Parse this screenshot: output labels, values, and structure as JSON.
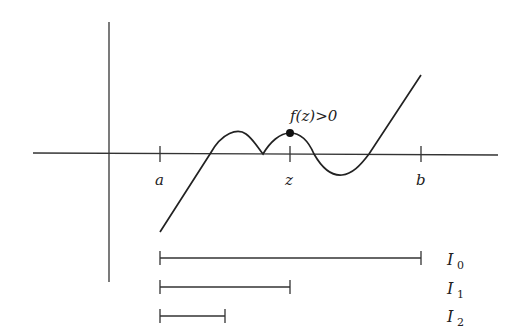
{
  "diagram": {
    "labels": {
      "a": "a",
      "z": "z",
      "b": "b",
      "annotation": "f(z)>0"
    },
    "intervals": [
      {
        "name": "I",
        "sub": "0",
        "from": "a",
        "to": "b"
      },
      {
        "name": "I",
        "sub": "1",
        "from": "a",
        "to": "z"
      },
      {
        "name": "I",
        "sub": "2",
        "from": "a",
        "to": "(a+z)/2"
      }
    ],
    "colors": {
      "stroke": "#222222",
      "background": "#ffffff"
    }
  }
}
